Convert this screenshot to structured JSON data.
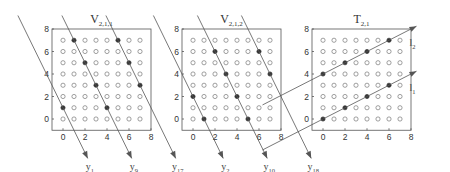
{
  "panels": [
    {
      "id": "v211",
      "title_main": "V",
      "title_sub": "2,1,1",
      "x_ticks": [
        "0",
        "2",
        "4",
        "6",
        "8"
      ],
      "y_ticks": [
        "0",
        "2",
        "4",
        "6",
        "8"
      ],
      "filled": [
        [
          1,
          7
        ],
        [
          5,
          7
        ],
        [
          2,
          5
        ],
        [
          6,
          5
        ],
        [
          3,
          3
        ],
        [
          7,
          3
        ],
        [
          0,
          1
        ],
        [
          4,
          1
        ]
      ],
      "lines": [
        {
          "label_main": "y",
          "label_sub": "1",
          "through": [
            0,
            1
          ],
          "direction": "down-right"
        },
        {
          "label_main": "y",
          "label_sub": "9",
          "through": [
            4,
            1
          ],
          "direction": "down-right"
        },
        {
          "label_main": "y",
          "label_sub": "17",
          "through": [
            8,
            1
          ],
          "direction": "down-right"
        }
      ]
    },
    {
      "id": "v212",
      "title_main": "V",
      "title_sub": "2,1,2",
      "x_ticks": [
        "0",
        "2",
        "4",
        "6",
        "8"
      ],
      "y_ticks": [
        "0",
        "2",
        "4",
        "6",
        "8"
      ],
      "filled": [
        [
          2,
          6
        ],
        [
          6,
          6
        ],
        [
          3,
          4
        ],
        [
          7,
          4
        ],
        [
          0,
          2
        ],
        [
          4,
          2
        ],
        [
          1,
          0
        ],
        [
          5,
          0
        ]
      ],
      "lines": [
        {
          "label_main": "y",
          "label_sub": "2",
          "through": [
            0,
            2
          ],
          "direction": "down-right"
        },
        {
          "label_main": "y",
          "label_sub": "10",
          "through": [
            4,
            2
          ],
          "direction": "down-right"
        },
        {
          "label_main": "y",
          "label_sub": "18",
          "through": [
            8,
            2
          ],
          "direction": "down-right"
        }
      ]
    },
    {
      "id": "t21",
      "title_main": "T",
      "title_sub": "2,1",
      "x_ticks": [
        "0",
        "2",
        "4",
        "6",
        "8"
      ],
      "y_ticks": [
        "0",
        "2",
        "4",
        "6",
        "8"
      ],
      "filled": [
        [
          0,
          0
        ],
        [
          2,
          1
        ],
        [
          4,
          2
        ],
        [
          6,
          3
        ],
        [
          0,
          4
        ],
        [
          2,
          5
        ],
        [
          4,
          6
        ],
        [
          6,
          7
        ]
      ],
      "lines": [
        {
          "label_main": "l",
          "label_sub": "1",
          "through": [
            0,
            0
          ],
          "direction": "up-right"
        },
        {
          "label_main": "l",
          "label_sub": "2",
          "through": [
            0,
            4
          ],
          "direction": "up-right"
        }
      ]
    }
  ]
}
